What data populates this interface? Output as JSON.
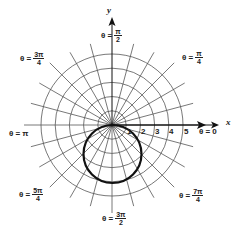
{
  "diagram": {
    "type": "polar-graph",
    "pole": {
      "x": 112,
      "y": 125
    },
    "unit_px": 14.2,
    "grid_circles": [
      1,
      2,
      3,
      4,
      5
    ],
    "radial_line_step_deg": 15,
    "axes": {
      "x_label": "x",
      "y_label": "y"
    },
    "tick_labels": [
      "1",
      "2",
      "3",
      "4",
      "5"
    ],
    "angle_labels": {
      "zero": {
        "prefix": "θ =",
        "value": "0"
      },
      "pi_over_4": {
        "prefix": "θ =",
        "num": "π",
        "den": "4"
      },
      "pi_over_2": {
        "prefix": "θ =",
        "num": "π",
        "den": "2"
      },
      "three_pi_over_4": {
        "prefix": "θ =",
        "num": "3π",
        "den": "4"
      },
      "pi": {
        "prefix": "θ =",
        "value": "π"
      },
      "five_pi_over_4": {
        "prefix": "θ =",
        "num": "5π",
        "den": "4"
      },
      "three_pi_over_2": {
        "prefix": "θ =",
        "num": "3π",
        "den": "2"
      },
      "seven_pi_over_4": {
        "prefix": "θ =",
        "num": "7π",
        "den": "4"
      }
    },
    "curve": {
      "description": "circle through pole below x-axis",
      "diameter_units": 4,
      "color": "#111111"
    },
    "colors": {
      "grid": "#555555",
      "axis": "#111111",
      "curve": "#111111",
      "background": "#ffffff"
    }
  }
}
